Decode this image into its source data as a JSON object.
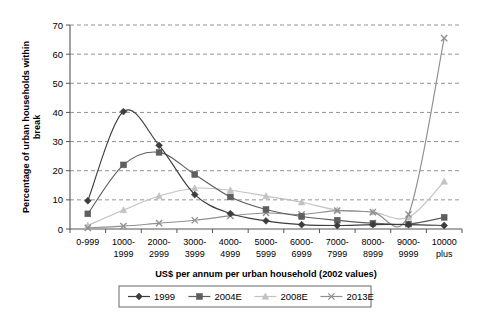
{
  "chart_data": {
    "type": "line",
    "title": "",
    "xlabel": "US$ per annum per urban household (2002 values)",
    "ylabel": "Percentage of urban households within break",
    "categories": [
      "0-999",
      "1000-1999",
      "2000-2999",
      "3000-3999",
      "4000-4999",
      "5000-5999",
      "6000-6999",
      "7000-7999",
      "8000-8999",
      "9000-9999",
      "10000 plus"
    ],
    "category_lines": [
      [
        "0-999",
        ""
      ],
      [
        "1000-",
        "1999"
      ],
      [
        "2000-",
        "2999"
      ],
      [
        "3000-",
        "3999"
      ],
      [
        "4000-",
        "4999"
      ],
      [
        "5000-",
        "5999"
      ],
      [
        "6000-",
        "6999"
      ],
      [
        "7000-",
        "7999"
      ],
      [
        "8000-",
        "8999"
      ],
      [
        "9000-",
        "9999"
      ],
      [
        "10000",
        "plus"
      ]
    ],
    "ylim": [
      0,
      70
    ],
    "yticks": [
      0,
      10,
      20,
      30,
      40,
      50,
      60,
      70
    ],
    "grid": true,
    "legend_position": "bottom",
    "series": [
      {
        "name": "1999",
        "marker": "diamond",
        "color": "#3d3d3d",
        "values": [
          9.7,
          40.3,
          28.7,
          11.8,
          5.3,
          2.8,
          1.5,
          1.2,
          1.5,
          1.5,
          1.2
        ]
      },
      {
        "name": "2004E",
        "marker": "square",
        "color": "#5e5e5e",
        "values": [
          5.2,
          22.0,
          26.3,
          18.7,
          11.0,
          6.7,
          4.3,
          3.0,
          2.0,
          1.7,
          4.0
        ]
      },
      {
        "name": "2008E",
        "marker": "triangle",
        "color": "#c2c2c2",
        "values": [
          1.2,
          6.5,
          11.3,
          14.0,
          13.3,
          11.3,
          9.2,
          6.5,
          5.8,
          4.0,
          16.3
        ]
      },
      {
        "name": "2013E",
        "marker": "cross",
        "color": "#8f8f8f",
        "values": [
          0.4,
          1.0,
          2.0,
          3.0,
          4.5,
          5.5,
          5.0,
          6.3,
          5.8,
          5.0,
          65.5
        ]
      }
    ]
  }
}
